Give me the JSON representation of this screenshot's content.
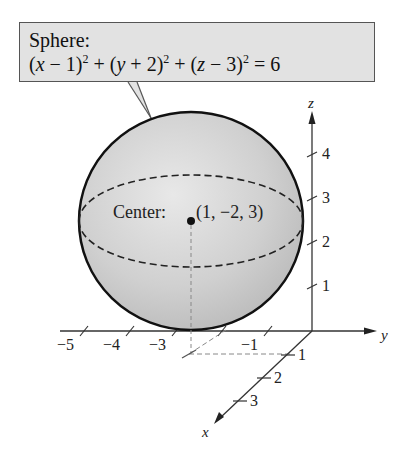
{
  "callout": {
    "title": "Sphere:",
    "equation_parts": [
      "(",
      "x",
      " − 1)",
      "2",
      " + (",
      "y",
      " + 2)",
      "2",
      " + (",
      "z",
      " − 3)",
      "2",
      " = 6"
    ],
    "equation_text": "(x − 1)^2 + (y + 2)^2 + (z − 3)^2 = 6"
  },
  "center": {
    "label": "Center:",
    "coords": "(1, −2, 3)"
  },
  "axes": {
    "z": {
      "name": "z",
      "ticks": [
        "1",
        "2",
        "3",
        "4"
      ]
    },
    "y": {
      "name": "y",
      "ticks": [
        "−5",
        "−4",
        "−3",
        "−1"
      ]
    },
    "x": {
      "name": "x",
      "ticks": [
        "1",
        "2",
        "3"
      ]
    }
  },
  "colors": {
    "sphere_fill": "#c9c9c9",
    "sphere_highlight": "#e6e6e6",
    "callout_fill": "#e2e2e2",
    "line": "#222222",
    "dashed": "#888888"
  }
}
